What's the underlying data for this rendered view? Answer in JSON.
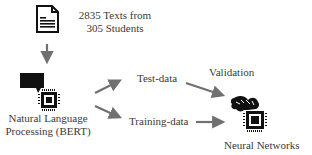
{
  "diagram": {
    "source": {
      "icon": "document-icon",
      "line1": "2835 Texts from",
      "line2": "305 Students"
    },
    "nlp": {
      "icon": "speech-bubble-chip-icon",
      "line1": "Natural Language",
      "line2": "Processing (BERT)"
    },
    "test_data": {
      "label": "Test-data"
    },
    "training_data": {
      "label": "Training-data"
    },
    "validation": {
      "label": "Validation"
    },
    "neural_networks": {
      "icon": "brain-chip-icon",
      "label": "Neural Networks"
    },
    "colors": {
      "arrow": "#707070",
      "icon": "#111111",
      "text": "#3a3a3a"
    }
  }
}
